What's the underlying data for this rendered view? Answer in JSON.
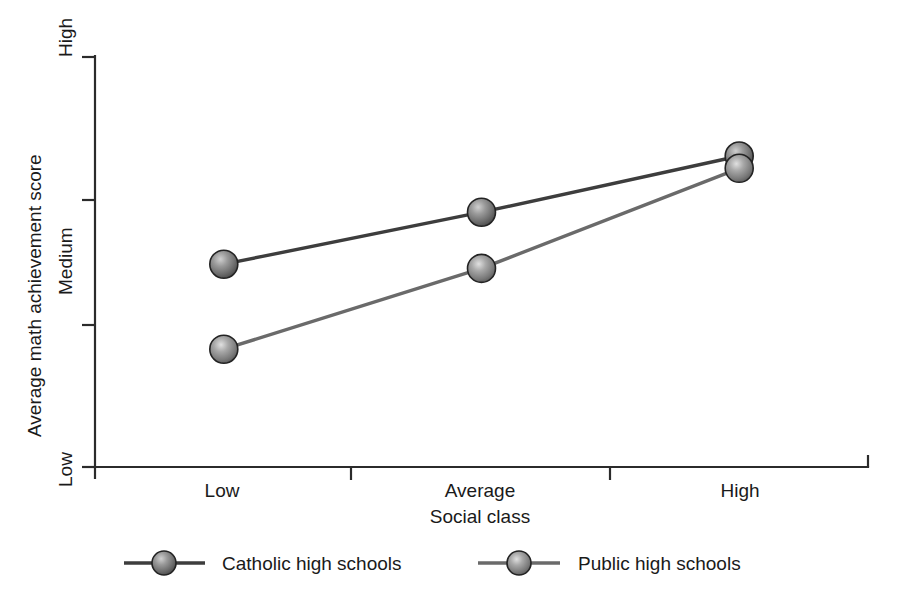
{
  "chart_data": {
    "type": "line",
    "title": "",
    "xlabel": "Social class",
    "ylabel": "Average math achievement score",
    "categories": [
      "Low",
      "Average",
      "High"
    ],
    "x_tick_labels": [
      "Low",
      "Average",
      "High"
    ],
    "y_tick_labels": [
      "Low",
      "Medium",
      "High"
    ],
    "ylim": [
      0,
      3
    ],
    "y_axis_ticks": [
      "Low",
      "Medium",
      "High"
    ],
    "grid": false,
    "legend_position": "bottom",
    "marker_style": "sphere",
    "series": [
      {
        "name": "Catholic high schools",
        "color": "#3d3d3d",
        "marker_color": "#7d7d7d",
        "values": [
          1.48,
          1.86,
          2.27
        ],
        "points": [
          {
            "category": "Low",
            "value": 1.48
          },
          {
            "category": "Average",
            "value": 1.86
          },
          {
            "category": "High",
            "value": 2.27
          }
        ]
      },
      {
        "name": "Public high schools",
        "color": "#6a6a6a",
        "marker_color": "#8e8e8e",
        "values": [
          0.86,
          1.45,
          2.18
        ],
        "points": [
          {
            "category": "Low",
            "value": 0.86
          },
          {
            "category": "Average",
            "value": 1.45
          },
          {
            "category": "High",
            "value": 2.18
          }
        ]
      }
    ],
    "legend": [
      {
        "label": "Catholic high schools",
        "color": "#3d3d3d"
      },
      {
        "label": "Public high schools",
        "color": "#6a6a6a"
      }
    ]
  },
  "axes": {
    "y_title": "Average math achievement score",
    "x_title": "Social class",
    "y_ticks": {
      "high": "High",
      "medium": "Medium",
      "low": "Low"
    },
    "x_ticks": {
      "low": "Low",
      "average": "Average",
      "high": "High"
    }
  },
  "legend": {
    "item0_label": "Catholic high schools",
    "item1_label": "Public high schools"
  }
}
